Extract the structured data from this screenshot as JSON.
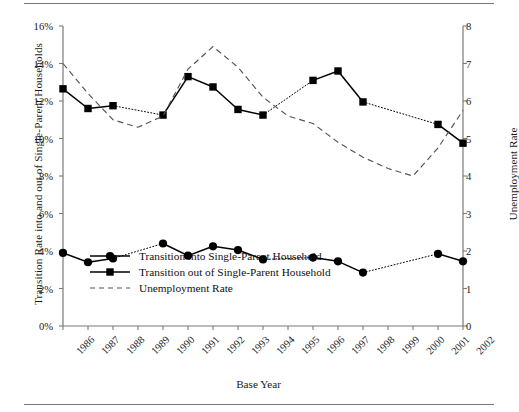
{
  "figure": {
    "x_axis_title": "Base Year",
    "y_axis_left_title": "Transition Rate into and out of Single-Parent Households",
    "y_axis_right_title": "Unemployment Rate"
  },
  "legend": {
    "items": [
      {
        "label": "Transition into Single-Parent Household",
        "key": "circle-solid-line",
        "color": "#000000"
      },
      {
        "label": "Transition out of Single-Parent Household",
        "key": "square-solid-line",
        "color": "#000000"
      },
      {
        "label": "Unemployment Rate",
        "key": "dashed-line",
        "color": "#555555"
      }
    ]
  },
  "chart_data": {
    "type": "line",
    "title": "",
    "xlabel": "Base Year",
    "ylabel": "Transition Rate into and out of Single-Parent Households",
    "y2label": "Unemployment Rate",
    "categories": [
      "1986",
      "1987",
      "1988",
      "1989",
      "1990",
      "1991",
      "1992",
      "1993",
      "1994",
      "1995",
      "1996",
      "1997",
      "1998",
      "1999",
      "2000",
      "2001",
      "2002"
    ],
    "xtick_labels": [
      "1986",
      "1987",
      "1988",
      "1989",
      "1990",
      "1991",
      "1992",
      "1993",
      "1994",
      "1995",
      "1996",
      "1997",
      "1998",
      "1999",
      "2000",
      "2001",
      "2002"
    ],
    "ylim": [
      0,
      16
    ],
    "ytick_labels": [
      "0%",
      "2%",
      "4%",
      "6%",
      "8%",
      "10%",
      "12%",
      "14%",
      "16%"
    ],
    "ytick_values": [
      0,
      2,
      4,
      6,
      8,
      10,
      12,
      14,
      16
    ],
    "y2lim": [
      0,
      8
    ],
    "y2tick_labels": [
      "0",
      "1",
      "2",
      "3",
      "4",
      "5",
      "6",
      "7",
      "8"
    ],
    "y2tick_values": [
      0,
      1,
      2,
      3,
      4,
      5,
      6,
      7,
      8
    ],
    "grid": false,
    "legend_position": "inside-lower-left",
    "series": [
      {
        "name": "Transition into Single-Parent Household",
        "axis": "left",
        "marker": "circle",
        "linestyle": "solid",
        "color": "#000000",
        "values": [
          3.9,
          3.4,
          3.6,
          null,
          4.4,
          3.75,
          4.25,
          4.05,
          3.55,
          null,
          3.65,
          3.45,
          2.85,
          null,
          null,
          3.85,
          3.45
        ]
      },
      {
        "name": "Transition out of Single-Parent Household",
        "axis": "left",
        "marker": "square",
        "linestyle": "solid",
        "color": "#000000",
        "values": [
          12.65,
          11.6,
          11.75,
          null,
          11.25,
          13.3,
          12.75,
          11.55,
          11.25,
          null,
          13.1,
          13.6,
          11.95,
          null,
          null,
          10.75,
          9.75
        ]
      },
      {
        "name": "Unemployment Rate",
        "axis": "right",
        "marker": "none",
        "linestyle": "dashed",
        "color": "#555555",
        "values": [
          7.0,
          6.2,
          5.5,
          5.3,
          5.6,
          6.85,
          7.45,
          6.9,
          6.1,
          5.6,
          5.4,
          4.9,
          4.5,
          4.2,
          4.0,
          4.75,
          5.75
        ]
      }
    ]
  }
}
